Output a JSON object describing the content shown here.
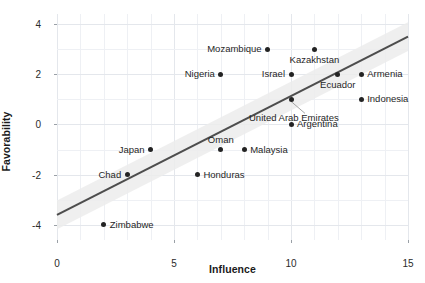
{
  "chart_data": {
    "type": "scatter",
    "title": "",
    "xlabel": "Influence",
    "ylabel": "Favorability",
    "xlim": [
      0,
      15
    ],
    "ylim": [
      -4.6,
      4.4
    ],
    "xticks": [
      0,
      5,
      10,
      15
    ],
    "xticklabels": [
      "0",
      "5",
      "10",
      "15"
    ],
    "yticks": [
      -4,
      -2,
      0,
      2,
      4
    ],
    "yticklabels": [
      "-4",
      "-2",
      "0",
      "2",
      "4"
    ],
    "grid": true,
    "minor_grid": true,
    "legend": "none",
    "colors": {
      "point": "#232323",
      "trendline": "#4d4d4d",
      "confidence_band": "#ececec",
      "grid": "#eef0f4",
      "text": "#1f1f1f"
    },
    "trendline": {
      "type": "linear-fit",
      "x_start": 0,
      "y_start": -3.6,
      "x_end": 15,
      "y_end": 3.5,
      "confidence_band": true
    },
    "points": [
      {
        "label": "Mozambique",
        "x": 9,
        "y": 3,
        "label_pos": "left"
      },
      {
        "label": "Kazakhstan",
        "x": 11,
        "y": 3,
        "label_pos": "below"
      },
      {
        "label": "Nigeria",
        "x": 7,
        "y": 2,
        "label_pos": "left"
      },
      {
        "label": "Israel",
        "x": 10,
        "y": 2,
        "label_pos": "left"
      },
      {
        "label": "Ecuador",
        "x": 12,
        "y": 2,
        "label_pos": "below"
      },
      {
        "label": "Armenia",
        "x": 13,
        "y": 2,
        "label_pos": "right"
      },
      {
        "label": "Indonesia",
        "x": 13,
        "y": 1,
        "label_pos": "right"
      },
      {
        "label": "United Arab Emirates",
        "x": 10,
        "y": 1,
        "label_pos": "leader"
      },
      {
        "label": "Argentina",
        "x": 10,
        "y": 0,
        "label_pos": "right"
      },
      {
        "label": "Japan",
        "x": 4,
        "y": -1,
        "label_pos": "left"
      },
      {
        "label": "Oman",
        "x": 7,
        "y": -1,
        "label_pos": "above"
      },
      {
        "label": "Malaysia",
        "x": 8,
        "y": -1,
        "label_pos": "right"
      },
      {
        "label": "Chad",
        "x": 3,
        "y": -2,
        "label_pos": "left"
      },
      {
        "label": "Honduras",
        "x": 6,
        "y": -2,
        "label_pos": "right"
      },
      {
        "label": "Zimbabwe",
        "x": 2,
        "y": -4,
        "label_pos": "right"
      }
    ]
  }
}
